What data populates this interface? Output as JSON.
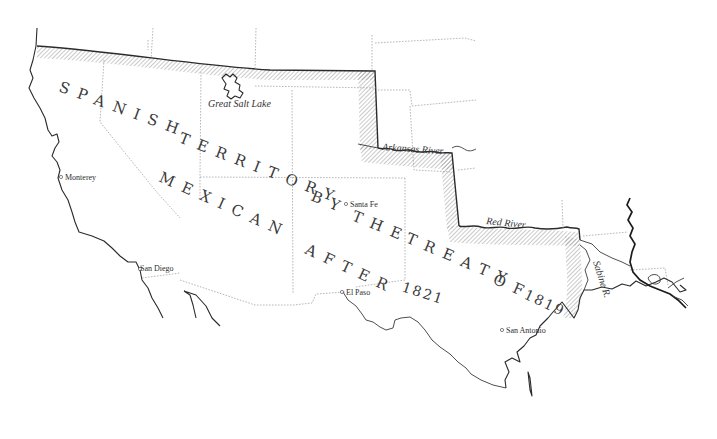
{
  "map": {
    "title_line_1": "SPANISH TERRITORY BY THE TREATY OF 1819",
    "title_line_1_parts": {
      "spanish": "SPANISH",
      "territory": "TERRITORY",
      "by": "BY",
      "the": "THE",
      "treaty": "TREATY",
      "of": "OF",
      "year": "1819"
    },
    "title_line_2": "MEXICAN AFTER 1821",
    "title_line_2_parts": {
      "mexican": "MEXICAN",
      "after": "AFTER",
      "year": "1821"
    },
    "places": [
      {
        "name": "Monterey"
      },
      {
        "name": "San Diego"
      },
      {
        "name": "Santa Fe"
      },
      {
        "name": "El Paso"
      },
      {
        "name": "San Antonio"
      }
    ],
    "water_labels": {
      "great_salt_lake": "Great Salt Lake",
      "arkansas_river": "Arkansas River",
      "red_river": "Red River",
      "sabine_river": "Sabine R."
    },
    "colors": {
      "background": "#ffffff",
      "ink": "#2a2a2a",
      "hatch": "#8a8a8a",
      "state_lines": "#9a9a9a"
    }
  }
}
